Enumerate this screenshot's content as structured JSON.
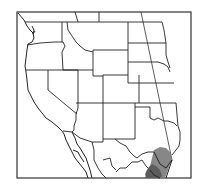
{
  "map": {
    "type": "species-range-map",
    "region": "Western United States and northern Mexico",
    "colors": {
      "background": "#ffffff",
      "borders": "#222222",
      "range_primary": "#7a7a7a",
      "range_dark": "#555555"
    },
    "range": {
      "description": "Shaded range in southern Texas and northeastern Mexico along the Gulf coast"
    }
  }
}
